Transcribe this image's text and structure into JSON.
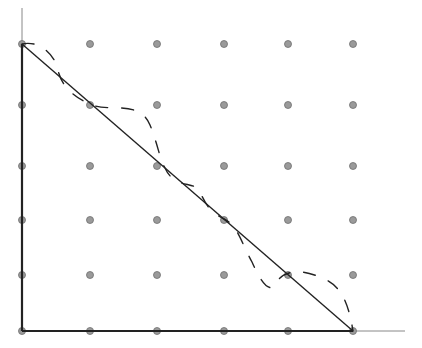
{
  "diagram": {
    "width": 422,
    "height": 348,
    "colors": {
      "axis": "#222222",
      "thin_axis": "#888888",
      "dot_fill": "#9a9a9a",
      "dot_stroke": "#6e6e6e",
      "line": "#222222",
      "dashed": "#222222"
    },
    "grid": {
      "xs": [
        22,
        90,
        157,
        224,
        288,
        353
      ],
      "ys": [
        44,
        105,
        166,
        220,
        275,
        331
      ]
    },
    "axes": {
      "origin": [
        22,
        331
      ],
      "y_top": 8,
      "x_right": 405
    },
    "straight_line": {
      "from": [
        22,
        44
      ],
      "to": [
        353,
        331
      ]
    },
    "dashed_curve": "M22,44 C40,40 55,55 58,70 C62,90 80,100 92,105 C110,112 140,100 150,125 C158,145 160,160 165,168 C175,190 195,180 200,192 C206,205 210,212 224,219 C238,226 240,240 252,262 C262,285 270,292 275,285 C282,270 300,268 322,278 C340,285 348,300 353,331"
  }
}
